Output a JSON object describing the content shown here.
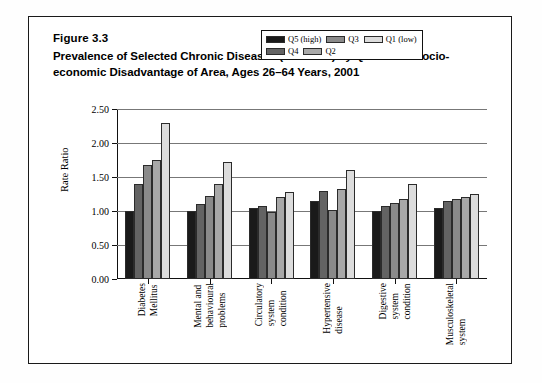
{
  "figure": {
    "number": "Figure 3.3",
    "title": "Prevalence of Selected Chronic Diseases (rate ratio) by Quintile of Socio-economic Disadvantage of Area, Ages 26–64 Years, 2001"
  },
  "chart_data": {
    "type": "bar",
    "title": "Prevalence of Selected Chronic Diseases (rate ratio) by Quintile of Socio-economic Disadvantage of Area, Ages 26–64 Years, 2001",
    "xlabel": "",
    "ylabel": "Rate Ratio",
    "ylim": [
      0.0,
      2.5
    ],
    "ytick_labels": [
      "0.00",
      "0.50",
      "1.00",
      "1.50",
      "2.00",
      "2.50"
    ],
    "ytick_values": [
      0.0,
      0.5,
      1.0,
      1.5,
      2.0,
      2.5
    ],
    "grid": true,
    "legend_position": "top-right-inside",
    "categories": [
      "Diabetes Mellitus",
      "Mental and behavioural problems",
      "Circulatory system condition",
      "Hypertensive disease",
      "Digestive system condition",
      "Musculoskeletal system"
    ],
    "category_lines": [
      [
        "Diabetes",
        "Mellitus"
      ],
      [
        "Mental and",
        "behavioural",
        "problems"
      ],
      [
        "Circulatory",
        "system",
        "condition"
      ],
      [
        "Hypertensive",
        "disease"
      ],
      [
        "Digestive",
        "system",
        "condition"
      ],
      [
        "Musculoskeletal",
        "system"
      ]
    ],
    "series": [
      {
        "name": "Q5 (high)",
        "color": "#1a1a1a",
        "values": [
          1.0,
          1.0,
          1.05,
          1.14,
          1.0,
          1.05
        ]
      },
      {
        "name": "Q4",
        "color": "#636363",
        "values": [
          1.4,
          1.1,
          1.08,
          1.3,
          1.08,
          1.15
        ]
      },
      {
        "name": "Q3",
        "color": "#8a8a8a",
        "values": [
          1.67,
          1.22,
          0.98,
          1.02,
          1.12,
          1.18
        ]
      },
      {
        "name": "Q2",
        "color": "#a8a8a8",
        "values": [
          1.75,
          1.4,
          1.2,
          1.33,
          1.17,
          1.2
        ]
      },
      {
        "name": "Q1 (low)",
        "color": "#dcdcdc",
        "values": [
          2.3,
          1.72,
          1.28,
          1.6,
          1.4,
          1.25
        ]
      }
    ]
  },
  "legend": {
    "row1": [
      {
        "label": "Q5 (high)",
        "color": "#1a1a1a"
      },
      {
        "label": "Q3",
        "color": "#8a8a8a"
      },
      {
        "label": "Q1 (low)",
        "color": "#dcdcdc"
      }
    ],
    "row2": [
      {
        "label": "Q4",
        "color": "#636363"
      },
      {
        "label": "Q2",
        "color": "#a8a8a8"
      }
    ]
  }
}
